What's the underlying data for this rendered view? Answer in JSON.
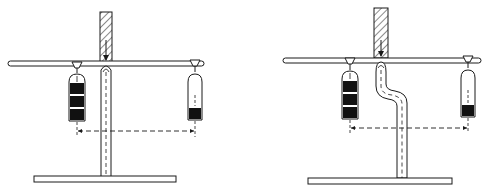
{
  "figure": {
    "colors": {
      "line": "#1a1a1a",
      "fill_dark": "#111111",
      "background": "#ffffff"
    },
    "panels": [
      {
        "id": "left",
        "support_shape": "straight",
        "left_container": {
          "segments_filled": 3,
          "fill_level": "full"
        },
        "right_container": {
          "segments_filled": 1,
          "fill_level": "quarter"
        }
      },
      {
        "id": "right",
        "support_shape": "offset-bent",
        "left_container": {
          "segments_filled": 3,
          "fill_level": "full"
        },
        "right_container": {
          "segments_filled": 1,
          "fill_level": "quarter"
        }
      }
    ]
  }
}
